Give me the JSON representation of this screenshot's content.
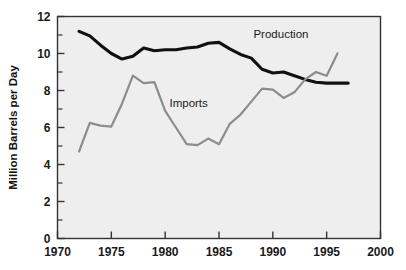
{
  "chart_data": {
    "type": "line",
    "title": "",
    "subtitle": "",
    "xlabel": "",
    "ylabel": "Million Barrels per Day",
    "xlim": [
      1970,
      2000
    ],
    "ylim": [
      0,
      12
    ],
    "xticks": [
      1970,
      1975,
      1980,
      1985,
      1990,
      1995,
      2000
    ],
    "xtick_labels": [
      "1970",
      "1975",
      "1980",
      "1985",
      "1990",
      "1995",
      "2000"
    ],
    "yticks": [
      0,
      2,
      4,
      6,
      8,
      10,
      12
    ],
    "ytick_labels": [
      "0",
      "2",
      "4",
      "6",
      "8",
      "10",
      "12"
    ],
    "minor_yticks": [
      1,
      3,
      5,
      7,
      9,
      11
    ],
    "grid": false,
    "legend_position": "inline-annotation",
    "plot_background": "#eeeeee",
    "figure_background": "#ffffff",
    "axis_color": "#333333",
    "series": [
      {
        "name": "Production",
        "color": "#111111",
        "line_width": 3.1,
        "label_x": 1988.2,
        "label_y": 11.05,
        "x": [
          1972,
          1973,
          1974,
          1975,
          1976,
          1977,
          1978,
          1979,
          1980,
          1981,
          1982,
          1983,
          1984,
          1985,
          1986,
          1987,
          1988,
          1989,
          1990,
          1991,
          1992,
          1993,
          1994,
          1995,
          1996,
          1997
        ],
        "values": [
          11.2,
          10.95,
          10.45,
          10.0,
          9.7,
          9.85,
          10.3,
          10.15,
          10.2,
          10.2,
          10.3,
          10.35,
          10.55,
          10.6,
          10.25,
          9.95,
          9.75,
          9.15,
          8.95,
          9.0,
          8.8,
          8.6,
          8.45,
          8.4,
          8.4,
          8.4
        ]
      },
      {
        "name": "Imports",
        "color": "#8c8c8c",
        "line_width": 2.2,
        "label_x": 1980.4,
        "label_y": 7.35,
        "x": [
          1972,
          1973,
          1974,
          1975,
          1976,
          1977,
          1978,
          1979,
          1980,
          1981,
          1982,
          1983,
          1984,
          1985,
          1986,
          1987,
          1988,
          1989,
          1990,
          1991,
          1992,
          1993,
          1994,
          1995,
          1996
        ],
        "values": [
          4.7,
          6.25,
          6.1,
          6.05,
          7.3,
          8.8,
          8.4,
          8.45,
          6.9,
          6.0,
          5.1,
          5.05,
          5.4,
          5.1,
          6.2,
          6.7,
          7.4,
          8.1,
          8.05,
          7.6,
          7.9,
          8.6,
          9.0,
          8.8,
          10.0
        ]
      }
    ]
  }
}
